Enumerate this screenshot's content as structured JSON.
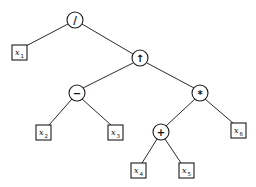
{
  "diagram": {
    "type": "expression-tree",
    "colors": {
      "stroke": "#1a1a1a",
      "background": "#ffffff"
    },
    "nodes": {
      "div": {
        "kind": "operator",
        "symbol": "/"
      },
      "pow": {
        "kind": "operator",
        "symbol": "↑"
      },
      "sub": {
        "kind": "operator",
        "symbol": "−"
      },
      "mul": {
        "kind": "operator",
        "symbol": "*"
      },
      "add": {
        "kind": "operator",
        "symbol": "+"
      },
      "x1": {
        "kind": "operand",
        "var": "x",
        "sub": "1"
      },
      "x2": {
        "kind": "operand",
        "var": "x",
        "sub": "2"
      },
      "x3": {
        "kind": "operand",
        "var": "x",
        "sub": "3"
      },
      "x4": {
        "kind": "operand",
        "var": "x",
        "sub": "4"
      },
      "x5": {
        "kind": "operand",
        "var": "x",
        "sub": "5"
      },
      "x6": {
        "kind": "operand",
        "var": "x",
        "sub": "6"
      }
    },
    "edges": [
      [
        "div",
        "x1"
      ],
      [
        "div",
        "pow"
      ],
      [
        "pow",
        "sub"
      ],
      [
        "pow",
        "mul"
      ],
      [
        "sub",
        "x2"
      ],
      [
        "sub",
        "x3"
      ],
      [
        "mul",
        "add"
      ],
      [
        "mul",
        "x6"
      ],
      [
        "add",
        "x4"
      ],
      [
        "add",
        "x5"
      ]
    ]
  }
}
